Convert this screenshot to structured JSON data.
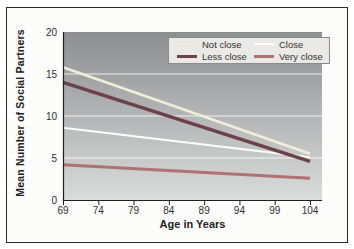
{
  "chart_data": {
    "type": "line",
    "title": "",
    "xlabel": "Age in Years",
    "ylabel": "Mean Number of Social Partners",
    "xlim": [
      69,
      104
    ],
    "ylim": [
      0,
      20
    ],
    "x_ticks": [
      69,
      74,
      79,
      84,
      89,
      94,
      99,
      104
    ],
    "y_ticks": [
      0,
      5,
      10,
      15,
      20
    ],
    "gridlines_y": [
      5,
      10,
      15
    ],
    "grid": true,
    "legend_position": "top-right",
    "x": [
      69,
      104
    ],
    "series": [
      {
        "name": "Not close",
        "values": [
          15.8,
          5.5
        ],
        "color": "#f2edd6",
        "width": 2.5
      },
      {
        "name": "Close",
        "values": [
          8.6,
          5.1
        ],
        "color": "#fdfdfc",
        "width": 2
      },
      {
        "name": "Less close",
        "values": [
          14.0,
          4.6
        ],
        "color": "#6e4048",
        "width": 3.5
      },
      {
        "name": "Very close",
        "values": [
          4.2,
          2.6
        ],
        "color": "#b07173",
        "width": 3
      }
    ],
    "colors": {
      "plot_bg_top": "#8c8e91",
      "plot_bg_bottom": "#dadcdb",
      "gridline": "#ffffff",
      "axis": "#1f1f1f",
      "tick_label": "#2e2e2e",
      "legend_bg": "#ebe9e5",
      "legend_border": "#8a8b8c"
    }
  }
}
